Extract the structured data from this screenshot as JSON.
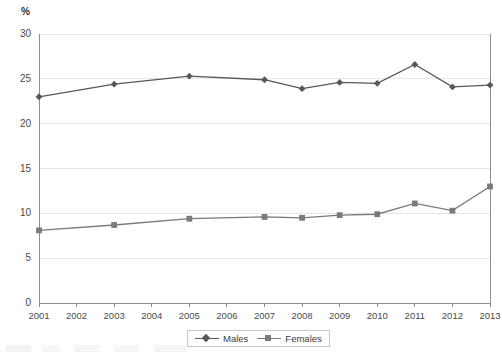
{
  "chart_data": {
    "type": "line",
    "title": "",
    "subtitle": "",
    "xlabel": "",
    "ylabel": "%",
    "unit_label": "%",
    "x": [
      2001,
      2002,
      2003,
      2004,
      2005,
      2006,
      2007,
      2008,
      2009,
      2010,
      2011,
      2012,
      2013
    ],
    "categories": [
      "2001",
      "2002",
      "2003",
      "2004",
      "2005",
      "2006",
      "2007",
      "2008",
      "2009",
      "2010",
      "2011",
      "2012",
      "2013"
    ],
    "xlim": [
      2001,
      2013
    ],
    "ylim": [
      0,
      30
    ],
    "yticks": [
      0,
      5,
      10,
      15,
      20,
      25,
      30
    ],
    "ytick_labels": [
      "0",
      "5",
      "10",
      "15",
      "20",
      "25",
      "30"
    ],
    "grid": true,
    "grid_axis": "y",
    "legend_position": "bottom-center",
    "marker_years": [
      2001,
      2003,
      2005,
      2007,
      2008,
      2009,
      2010,
      2011,
      2012,
      2013
    ],
    "series": [
      {
        "name": "Males",
        "marker": "diamond",
        "color": "#585858",
        "x": [
          2001,
          2003,
          2005,
          2007,
          2008,
          2009,
          2010,
          2011,
          2012,
          2013
        ],
        "values": [
          23.0,
          24.4,
          25.3,
          24.9,
          23.9,
          24.6,
          24.5,
          26.6,
          24.1,
          24.3
        ]
      },
      {
        "name": "Females",
        "marker": "square",
        "color": "#7a7a7a",
        "x": [
          2001,
          2003,
          2005,
          2007,
          2008,
          2009,
          2010,
          2011,
          2012,
          2013
        ],
        "values": [
          8.1,
          8.7,
          9.4,
          9.6,
          9.5,
          9.8,
          9.9,
          11.1,
          10.3,
          13.0
        ]
      }
    ]
  },
  "legend": {
    "items": [
      {
        "label": "Males",
        "marker": "diamond",
        "color": "#585858"
      },
      {
        "label": "Females",
        "marker": "square",
        "color": "#7a7a7a"
      }
    ]
  },
  "colors": {
    "males": "#585858",
    "females": "#7a7a7a",
    "grid": "#e6e6e6",
    "axis": "#8d8d8d",
    "text": "#4a4a4a",
    "background": "#ffffff"
  }
}
